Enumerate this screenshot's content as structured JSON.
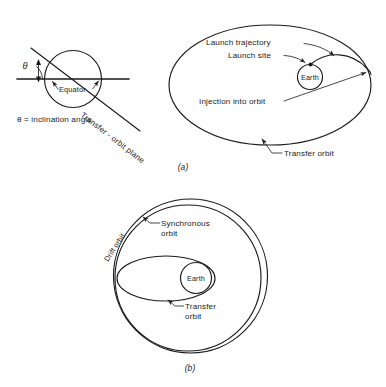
{
  "figure": {
    "background_color": "#ffffff",
    "line_color": "#1b1b1b"
  },
  "panel_a": {
    "caption": "(a)",
    "labels": {
      "theta_symbol": "θ",
      "equator": "Equator",
      "inclination_note": "θ = inclination angle",
      "transfer_orbit_plane": "Transfer - orbit plane",
      "launch_trajectory": "Launch trajectory",
      "launch_site": "Launch site",
      "injection_into_orbit": "Injection into orbit",
      "earth": "Earth",
      "transfer_orbit": "Transfer orbit"
    }
  },
  "panel_b": {
    "caption": "(b)",
    "labels": {
      "drift_orbit": "Drift orbit",
      "synchronous_orbit_line1": "Synchronous",
      "synchronous_orbit_line2": "orbit",
      "earth": "Earth",
      "transfer_orbit_line1": "Transfer",
      "transfer_orbit_line2": "orbit"
    }
  }
}
